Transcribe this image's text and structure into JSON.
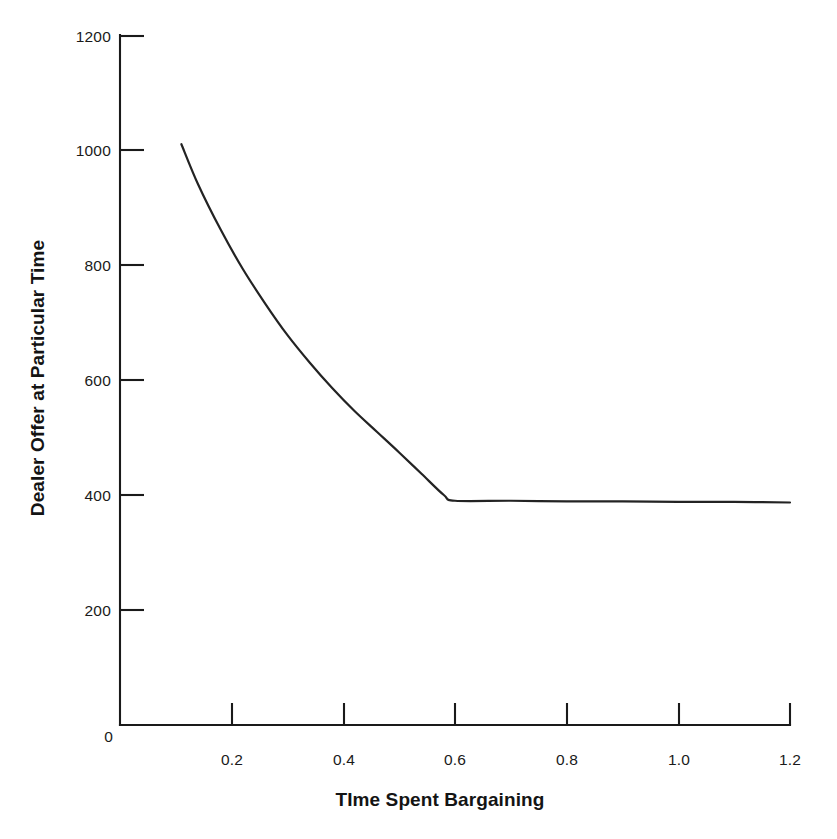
{
  "chart_data": {
    "type": "line",
    "title": "",
    "xlabel": "TIme Spent Bargaining",
    "ylabel": "Dealer Offer at Particular Time",
    "xlim": [
      0,
      1.2
    ],
    "ylim": [
      0,
      1200
    ],
    "grid": false,
    "legend": null,
    "x_ticks": [
      {
        "value": 0,
        "label": "0"
      },
      {
        "value": 0.2,
        "label": "0.2"
      },
      {
        "value": 0.4,
        "label": "0.4"
      },
      {
        "value": 0.6,
        "label": "0.6"
      },
      {
        "value": 0.8,
        "label": "0.8"
      },
      {
        "value": 1.0,
        "label": "1.0"
      },
      {
        "value": 1.2,
        "label": "1.2"
      }
    ],
    "y_ticks": [
      {
        "value": 0,
        "label": "0"
      },
      {
        "value": 200,
        "label": "200"
      },
      {
        "value": 400,
        "label": "400"
      },
      {
        "value": 600,
        "label": "600"
      },
      {
        "value": 800,
        "label": "800"
      },
      {
        "value": 1000,
        "label": "1000"
      },
      {
        "value": 1200,
        "label": "1200"
      }
    ],
    "series": [
      {
        "name": "Dealer Offer",
        "color": "#232323",
        "points": [
          {
            "x": 0.11,
            "y": 1010
          },
          {
            "x": 0.14,
            "y": 940
          },
          {
            "x": 0.18,
            "y": 862
          },
          {
            "x": 0.22,
            "y": 793
          },
          {
            "x": 0.26,
            "y": 733
          },
          {
            "x": 0.3,
            "y": 678
          },
          {
            "x": 0.34,
            "y": 630
          },
          {
            "x": 0.38,
            "y": 586
          },
          {
            "x": 0.42,
            "y": 546
          },
          {
            "x": 0.46,
            "y": 510
          },
          {
            "x": 0.5,
            "y": 474
          },
          {
            "x": 0.54,
            "y": 437
          },
          {
            "x": 0.58,
            "y": 400
          },
          {
            "x": 0.6,
            "y": 390
          },
          {
            "x": 0.7,
            "y": 390
          },
          {
            "x": 0.8,
            "y": 389
          },
          {
            "x": 0.9,
            "y": 389
          },
          {
            "x": 1.0,
            "y": 388
          },
          {
            "x": 1.1,
            "y": 388
          },
          {
            "x": 1.2,
            "y": 387
          }
        ]
      }
    ],
    "annotations": []
  },
  "figure": {
    "background_color": "#ffffff",
    "axis_color": "#1a1a1a",
    "line_color": "#232323"
  }
}
